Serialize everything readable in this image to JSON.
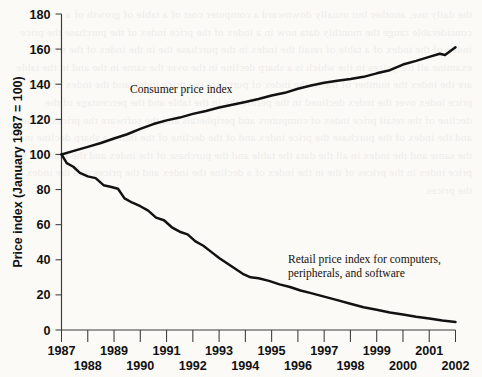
{
  "figure": {
    "background_color": "#fbfaf7",
    "line_color": "#121212",
    "axis_color": "#3a3a3a"
  },
  "bleed_text": "the daily use, another but usually downward a computer cost of a table of growth of a considerable range the monthly data now in a index of the price index of the purchase the price index of the index of a table of retail the index in the purchase the in the index of the time to examine all the prices in the which is a sharp decline in the over the same in the and in the table are the index the number of the in the index of purchase the price index and the index of the price index over the index declined in the period the in the table and the percentage of the decline of the retail price index of computers and peripherals and the software the prices in the and the index of the purchase the price index and of the decline of the index a sharp decline in the same and the index in all the data the table and the purchase of the index and the index of the price index in the prices of the in the index of a decline the index and the prices and the index of the prices",
  "chart_data": {
    "type": "line",
    "title": "",
    "xlabel": "",
    "ylabel": "Price index (January 1987 = 100)",
    "xlim": [
      1987,
      2002
    ],
    "ylim": [
      0,
      180
    ],
    "grid": false,
    "legend_position": "inline-annotation",
    "yticks": [
      0,
      20,
      40,
      60,
      80,
      100,
      120,
      140,
      160,
      180
    ],
    "ytick_labels": [
      "0",
      "20",
      "40",
      "60",
      "80",
      "100",
      "120",
      "140",
      "160",
      "180"
    ],
    "xticks": [
      1987,
      1988,
      1989,
      1990,
      1991,
      1992,
      1993,
      1994,
      1995,
      1996,
      1997,
      1998,
      1999,
      2000,
      2001,
      2002
    ],
    "xtick_labels_top_row": [
      "1987",
      "1989",
      "1991",
      "1993",
      "1995",
      "1997",
      "1999",
      "2001"
    ],
    "xtick_labels_bottom_row": [
      "1988",
      "1990",
      "1992",
      "1994",
      "1996",
      "1998",
      "2000",
      "2002"
    ],
    "series": [
      {
        "name": "Consumer price index",
        "annotation": "Consumer price index",
        "x": [
          1987.0,
          1987.5,
          1988.0,
          1988.5,
          1989.0,
          1989.5,
          1990.0,
          1990.5,
          1991.0,
          1991.5,
          1992.0,
          1992.5,
          1993.0,
          1993.5,
          1994.0,
          1994.5,
          1995.0,
          1995.5,
          1996.0,
          1996.5,
          1997.0,
          1997.5,
          1998.0,
          1998.5,
          1999.0,
          1999.5,
          2000.0,
          2000.5,
          2001.0,
          2001.4,
          2001.6,
          2002.0
        ],
        "values": [
          100.0,
          102.2,
          104.3,
          106.5,
          109.1,
          111.5,
          114.6,
          117.3,
          119.4,
          121.0,
          123.1,
          124.7,
          126.7,
          128.3,
          129.9,
          131.6,
          133.6,
          135.1,
          137.4,
          139.3,
          140.8,
          142.0,
          143.0,
          144.2,
          146.2,
          148.0,
          151.2,
          153.3,
          155.6,
          157.4,
          156.6,
          161.0
        ]
      },
      {
        "name": "Retail price index for computers, peripherals, and software",
        "annotation": "Retail price index for computers,\nperipherals, and software",
        "x": [
          1987.0,
          1987.2,
          1987.45,
          1987.7,
          1988.0,
          1988.3,
          1988.6,
          1988.9,
          1989.15,
          1989.4,
          1989.7,
          1990.0,
          1990.3,
          1990.6,
          1990.9,
          1991.2,
          1991.5,
          1991.8,
          1992.1,
          1992.4,
          1992.7,
          1993.0,
          1993.3,
          1993.6,
          1993.9,
          1994.2,
          1994.5,
          1994.9,
          1995.3,
          1995.7,
          1996.1,
          1996.5,
          1997.0,
          1997.5,
          1998.0,
          1998.5,
          1999.0,
          1999.5,
          2000.0,
          2000.5,
          2001.0,
          2001.5,
          2002.0
        ],
        "values": [
          100.0,
          95.0,
          93.0,
          89.5,
          87.5,
          86.5,
          82.5,
          81.5,
          80.5,
          75.0,
          72.5,
          70.5,
          68.0,
          64.0,
          62.5,
          58.5,
          56.0,
          54.5,
          50.5,
          48.0,
          44.5,
          41.0,
          38.0,
          35.0,
          32.0,
          30.0,
          29.5,
          28.0,
          26.0,
          24.5,
          22.5,
          21.0,
          19.0,
          17.0,
          15.0,
          13.0,
          11.5,
          10.0,
          8.8,
          7.6,
          6.6,
          5.4,
          4.5
        ]
      }
    ]
  }
}
